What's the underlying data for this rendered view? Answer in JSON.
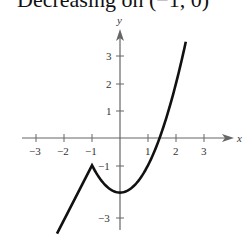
{
  "heading": "Decreasing on (−1, 0)",
  "colors": {
    "axis": "#666666",
    "curve": "#111111",
    "text": "#333333"
  },
  "chart_data": {
    "type": "line",
    "title": "Decreasing on (−1, 0)",
    "xlabel": "x",
    "ylabel": "y",
    "xlim": [
      -3.5,
      4
    ],
    "ylim": [
      -3.5,
      4
    ],
    "x_ticks": [
      -3,
      -2,
      -1,
      1,
      2,
      3
    ],
    "x_tick_labels": [
      "−3",
      "−2",
      "−1",
      "1",
      "2",
      "3"
    ],
    "y_ticks": [
      -3,
      -1,
      1,
      2,
      3
    ],
    "y_tick_labels": [
      "−3",
      "−1",
      "1",
      "2",
      "3"
    ],
    "grid": false,
    "series": [
      {
        "name": "f(x) piecewise",
        "description": "Linear for x < -1: y = 2x + 1; parabola for x >= -1: y = x^2 - 2",
        "x": [
          -2.25,
          -1.5,
          -1,
          -0.5,
          0,
          0.5,
          1,
          1.414,
          2,
          2.35
        ],
        "y": [
          -3.5,
          -2,
          -1,
          -1.75,
          -2,
          -1.75,
          -1,
          0,
          2,
          3.52
        ]
      }
    ],
    "key_points": [
      {
        "label": "corner (relative max)",
        "x": -1,
        "y": -1
      },
      {
        "label": "relative min",
        "x": 0,
        "y": -2
      }
    ]
  }
}
